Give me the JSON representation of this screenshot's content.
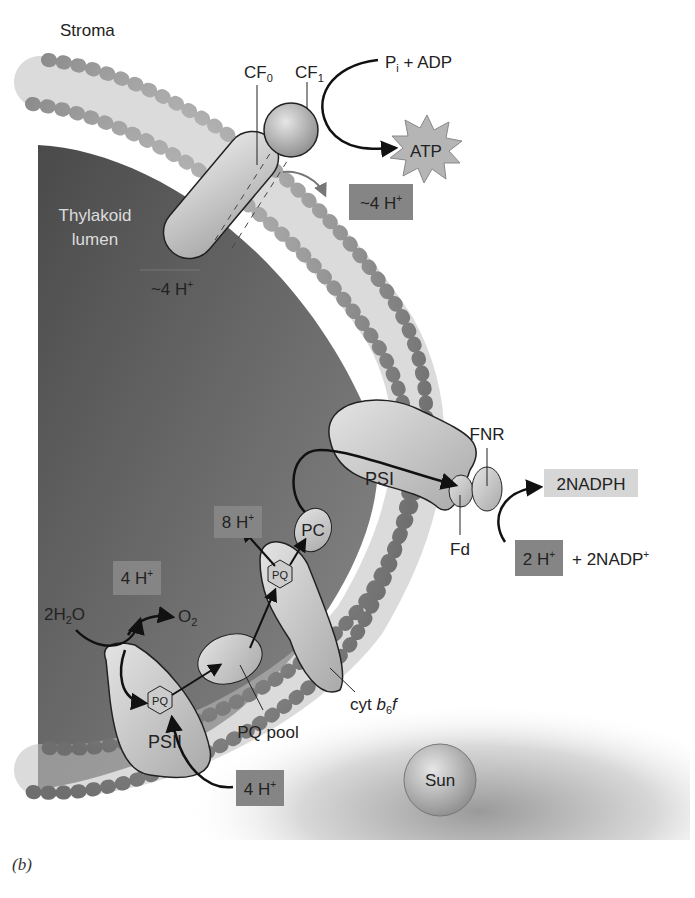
{
  "regions": {
    "stroma": "Stroma",
    "lumen_line1": "Thylakoid",
    "lumen_line2": "lumen"
  },
  "atp_synthase": {
    "cf0": "CF",
    "cf0_sub": "0",
    "cf1": "CF",
    "cf1_sub": "1",
    "substrate_p": "P",
    "substrate_p_sub": "i",
    "substrate_rest": " + ADP",
    "product": "ATP",
    "protons_lumen": "~4 H",
    "protons_stroma": "~4 H",
    "sup": "+"
  },
  "photosystem_ii": {
    "label": "PSII",
    "water": "2H",
    "water_sub": "2",
    "water_end": "O",
    "oxygen": "O",
    "oxygen_sub": "2",
    "protons_lumen": "4 H",
    "protons_stroma": "4 H",
    "pq": "PQ"
  },
  "pq_pool": {
    "label": "PQ pool"
  },
  "cytochrome": {
    "label_prefix": "cyt ",
    "label_b": "b",
    "label_sub": "6",
    "label_f": "f",
    "pq": "PQ",
    "protons": "8 H"
  },
  "plastocyanin": {
    "label": "PC"
  },
  "photosystem_i": {
    "label": "PSI"
  },
  "ferredoxin": {
    "label": "Fd"
  },
  "fnr": {
    "label": "FNR",
    "product": "2NADPH",
    "substrate_h": "2 H",
    "substrate_rest": "+ 2NADP"
  },
  "light_source": {
    "label": "Sun"
  },
  "caption": "(b)",
  "colors": {
    "lumen": "#555555",
    "protein": "#c8c8c8",
    "lipid_head": "#8a8a8a",
    "proton_box_dark": "#7a7a7a",
    "proton_box_light": "#cfcfcf"
  }
}
